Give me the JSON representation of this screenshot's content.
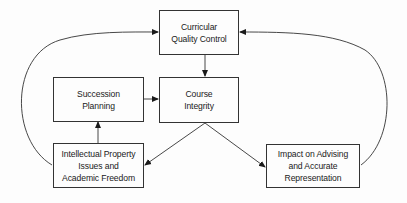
{
  "diagram": {
    "colors": {
      "stroke": "#333333",
      "text": "#1a1a1a",
      "background": "#fdfdfd"
    },
    "nodes": {
      "curricular_quality_control": {
        "lines": [
          "Curricular",
          "Quality Control"
        ]
      },
      "course_integrity": {
        "lines": [
          "Course",
          "Integrity"
        ]
      },
      "succession_planning": {
        "lines": [
          "Succession",
          "Planning"
        ]
      },
      "intellectual_property": {
        "lines": [
          "Intellectual Property",
          "Issues and",
          "Academic Freedom"
        ]
      },
      "impact_on_advising": {
        "lines": [
          "Impact on Advising",
          "and Accurate",
          "Representation"
        ]
      }
    },
    "edges": [
      {
        "from": "Curricular Quality Control",
        "to": "Course Integrity",
        "style": "straight"
      },
      {
        "from": "Succession Planning",
        "to": "Course Integrity",
        "style": "straight"
      },
      {
        "from": "Intellectual Property Issues and Academic Freedom",
        "to": "Succession Planning",
        "style": "straight"
      },
      {
        "from": "Course Integrity",
        "to": "Intellectual Property Issues and Academic Freedom",
        "style": "straight"
      },
      {
        "from": "Course Integrity",
        "to": "Impact on Advising and Accurate Representation",
        "style": "straight"
      },
      {
        "from": "Intellectual Property Issues and Academic Freedom",
        "to": "Curricular Quality Control",
        "style": "curved"
      },
      {
        "from": "Impact on Advising and Accurate Representation",
        "to": "Curricular Quality Control",
        "style": "curved"
      }
    ]
  }
}
